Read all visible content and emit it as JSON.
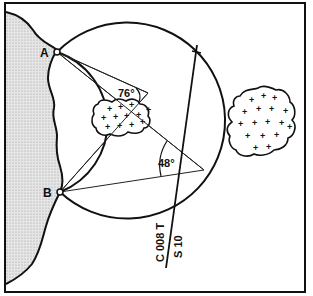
{
  "diagram": {
    "type": "navigation-horizontal-danger-angle",
    "points": {
      "A": {
        "label": "A",
        "x": 57,
        "y": 52
      },
      "B": {
        "label": "B",
        "x": 60,
        "y": 192
      }
    },
    "angles": {
      "max_angle": {
        "label": "76°",
        "value": 76
      },
      "min_angle": {
        "label": "48°",
        "value": 48
      }
    },
    "course_line": {
      "course_label": "C 008 T",
      "speed_label": "S 10"
    },
    "circles": {
      "inner": {
        "cx": 82.5,
        "cy": 122,
        "r": 74.5
      },
      "outer": {
        "cx": 125,
        "cy": 122,
        "r": 98
      }
    },
    "hazards": [
      {
        "name": "shoal-inside",
        "marker": "+"
      },
      {
        "name": "shoal-outside",
        "marker": "+"
      }
    ],
    "colors": {
      "ink": "#111111",
      "land": "#d9d9d9",
      "background": "#ffffff"
    }
  }
}
